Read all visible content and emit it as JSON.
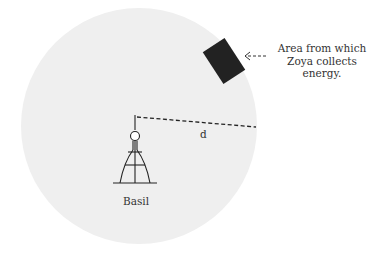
{
  "diagram": {
    "colors": {
      "background": "#ffffff",
      "circle_fill": "#efefef",
      "ink": "#222222",
      "patch": "#222222"
    },
    "tower": {
      "label": "Basil"
    },
    "distance": {
      "label": "d"
    },
    "patch": {
      "annotation_line1": "Area from which",
      "annotation_line2": "Zoya collects energy."
    }
  }
}
